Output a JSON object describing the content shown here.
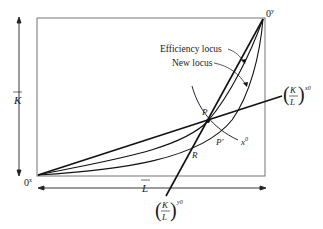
{
  "diagram": {
    "type": "edgeworth-box",
    "origins": {
      "x": "0",
      "x_sup": "x",
      "y": "0",
      "y_sup": "y"
    },
    "axes": {
      "vertical": "K",
      "horizontal": "L"
    },
    "labels": {
      "efficiency_locus": "Efficiency locus",
      "new_locus": "New locus",
      "point_p": "P",
      "point_p_prime": "P'",
      "point_r": "R",
      "isoquant": "x",
      "isoquant_sup": "0",
      "ray_x": {
        "num": "K",
        "den": "L",
        "sup": "x0"
      },
      "ray_y": {
        "num": "K",
        "den": "L",
        "sup": "y0"
      }
    },
    "colors": {
      "line": "#1a1a1a",
      "box": "#555555"
    }
  }
}
